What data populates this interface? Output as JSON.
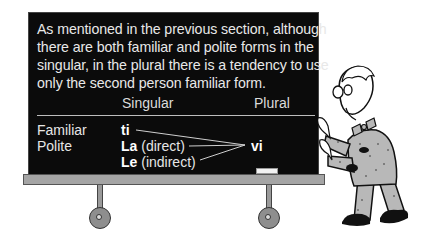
{
  "board": {
    "paragraph": [
      "As mentioned in the previous section, although",
      "there are both familiar and polite forms in the",
      "singular, in the plural there is a tendency to use",
      "only the second person familiar form."
    ],
    "table": {
      "headers": {
        "singular": "Singular",
        "plural": "Plural"
      },
      "rows": [
        {
          "label": "Familiar",
          "form_bold": "ti",
          "form_note": ""
        },
        {
          "label": "Polite",
          "form_bold": "La",
          "form_note": " (direct)"
        },
        {
          "label": "",
          "form_bold": "Le",
          "form_note": " (indirect)"
        }
      ],
      "plural_form": "vi"
    }
  },
  "illustration": {
    "description": "cartoon professor with glasses and bow tie pushing a wheeled chalkboard",
    "colors": {
      "board": "#0b0b0b",
      "ledge": "#a5a5a5",
      "suit": "#b8b8b8",
      "text": "#e8e8e8"
    }
  }
}
